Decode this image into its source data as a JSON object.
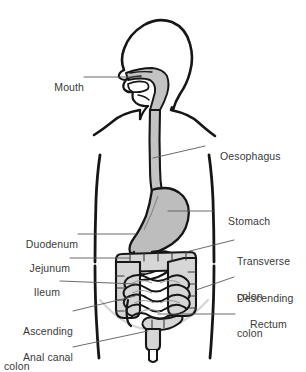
{
  "figure": {
    "background_color": "#ffffff",
    "outline_color": "#1a1a1a",
    "organ_fill_color": "#bfbfbf",
    "intestine_fill_color": "#d9d9d9",
    "leader_line_color": "#5a5a5a",
    "pelvis_arc_color": "#d0d0d0",
    "text_color": "#3a3a3a"
  },
  "labels": [
    {
      "id": "mouth",
      "text": "Mouth",
      "side": "left",
      "x": 46,
      "y": 72,
      "lines": [
        "Mouth"
      ]
    },
    {
      "id": "oesophagus",
      "text": "Oesophagus",
      "side": "right",
      "x": 208,
      "y": 140,
      "lines": [
        "Oesophagus"
      ]
    },
    {
      "id": "stomach",
      "text": "Stomach",
      "side": "right",
      "x": 216,
      "y": 205,
      "lines": [
        "Stomach"
      ]
    },
    {
      "id": "duodenum",
      "text": "Duodenum",
      "side": "left",
      "x": 16,
      "y": 228,
      "lines": [
        "Duodenum"
      ]
    },
    {
      "id": "transverse-colon",
      "text": "Transverse colon",
      "side": "right",
      "x": 237,
      "y": 234,
      "lines": [
        "Transverse",
        "colon"
      ]
    },
    {
      "id": "jejunum",
      "text": "Jejunum",
      "side": "left",
      "x": 22,
      "y": 252,
      "lines": [
        "Jejunum"
      ]
    },
    {
      "id": "descending-colon",
      "text": "Descending colon",
      "side": "right",
      "x": 237,
      "y": 271,
      "lines": [
        "Descending",
        "colon"
      ]
    },
    {
      "id": "ileum",
      "text": "Ileum",
      "side": "left",
      "x": 30,
      "y": 275,
      "lines": [
        "Ileum"
      ]
    },
    {
      "id": "ascending-colon",
      "text": "Ascending colon",
      "side": "left",
      "x": 17,
      "y": 304,
      "lines": [
        "Ascending",
        "colon"
      ]
    },
    {
      "id": "rectum",
      "text": "Rectum",
      "side": "right",
      "x": 238,
      "y": 308,
      "lines": [
        "Rectum"
      ]
    },
    {
      "id": "anal-canal",
      "text": "Anal canal",
      "side": "left",
      "x": 17,
      "y": 341,
      "lines": [
        "Anal canal"
      ]
    }
  ],
  "leader_lines": [
    {
      "id": "mouth",
      "x1": 84,
      "y1": 77,
      "x2": 141,
      "y2": 77
    },
    {
      "id": "oesophagus",
      "x1": 153,
      "y1": 158,
      "x2": 205,
      "y2": 146
    },
    {
      "id": "stomach",
      "x1": 168,
      "y1": 211,
      "x2": 213,
      "y2": 211
    },
    {
      "id": "duodenum",
      "x1": 78,
      "y1": 234,
      "x2": 136,
      "y2": 234
    },
    {
      "id": "transverse-colon",
      "x1": 186,
      "y1": 252,
      "x2": 234,
      "y2": 240
    },
    {
      "id": "jejunum",
      "x1": 70,
      "y1": 258,
      "x2": 130,
      "y2": 258
    },
    {
      "id": "descending-colon",
      "x1": 196,
      "y1": 290,
      "x2": 234,
      "y2": 277
    },
    {
      "id": "ileum",
      "x1": 60,
      "y1": 281,
      "x2": 136,
      "y2": 284
    },
    {
      "id": "ascending-colon",
      "x1": 73,
      "y1": 311,
      "x2": 135,
      "y2": 296
    },
    {
      "id": "rectum",
      "x1": 158,
      "y1": 314,
      "x2": 235,
      "y2": 314
    },
    {
      "id": "anal-canal",
      "x1": 73,
      "y1": 347,
      "x2": 148,
      "y2": 331
    }
  ],
  "organs": [
    {
      "id": "head-profile",
      "name": "head and neck in left-facing profile"
    },
    {
      "id": "oral-cavity",
      "name": "mouth and pharynx cavity"
    },
    {
      "id": "oesophagus",
      "name": "oesophagus tube"
    },
    {
      "id": "stomach",
      "name": "stomach"
    },
    {
      "id": "duodenum",
      "name": "duodenum loop"
    },
    {
      "id": "small-intestine",
      "name": "jejunum and ileum coils"
    },
    {
      "id": "ascending-colon",
      "name": "ascending colon"
    },
    {
      "id": "transverse-colon",
      "name": "transverse colon"
    },
    {
      "id": "descending-colon",
      "name": "descending colon"
    },
    {
      "id": "sigmoid-colon",
      "name": "sigmoid colon"
    },
    {
      "id": "rectum",
      "name": "rectum"
    },
    {
      "id": "anal-canal",
      "name": "anal canal"
    },
    {
      "id": "appendix",
      "name": "vermiform appendix"
    },
    {
      "id": "torso-outline",
      "name": "torso body outline"
    },
    {
      "id": "pelvis-arc",
      "name": "pelvic brim arc"
    }
  ]
}
